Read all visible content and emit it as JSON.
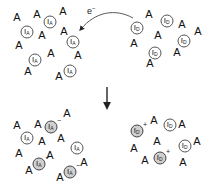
{
  "diagram": {
    "electron_label": "e",
    "electron_sign": "−",
    "colors": {
      "ink": "#111111",
      "neutral_fill": "#ffffff",
      "ion_fill": "#cfcfcf",
      "outline": "#555555"
    },
    "panels": {
      "top_left": {
        "species": "I",
        "subscript": "A",
        "A": [
          [
            17,
            17
          ],
          [
            37,
            14
          ],
          [
            63,
            11
          ],
          [
            42,
            35
          ],
          [
            64,
            31
          ],
          [
            19,
            45
          ],
          [
            51,
            53
          ],
          [
            78,
            55
          ],
          [
            28,
            71
          ],
          [
            59,
            76
          ]
        ],
        "molecules": [
          {
            "x": 50,
            "y": 22,
            "ion": false,
            "charge": ""
          },
          {
            "x": 27,
            "y": 32,
            "ion": false,
            "charge": ""
          },
          {
            "x": 73,
            "y": 42,
            "ion": false,
            "charge": ""
          },
          {
            "x": 35,
            "y": 60,
            "ion": false,
            "charge": ""
          },
          {
            "x": 70,
            "y": 71,
            "ion": false,
            "charge": ""
          }
        ]
      },
      "top_right": {
        "species": "I",
        "subscript": "D",
        "A": [
          [
            149,
            14
          ],
          [
            182,
            24
          ],
          [
            198,
            31
          ],
          [
            158,
            35
          ],
          [
            134,
            43
          ],
          [
            177,
            52
          ],
          [
            150,
            63
          ]
        ],
        "molecules": [
          {
            "x": 167,
            "y": 21,
            "ion": false,
            "charge": ""
          },
          {
            "x": 137,
            "y": 28,
            "ion": false,
            "charge": ""
          },
          {
            "x": 184,
            "y": 41,
            "ion": false,
            "charge": ""
          },
          {
            "x": 155,
            "y": 53,
            "ion": false,
            "charge": ""
          }
        ]
      },
      "bottom_left": {
        "species": "I",
        "subscript": "A",
        "A": [
          [
            67,
            113
          ],
          [
            17,
            125
          ],
          [
            38,
            124
          ],
          [
            42,
            141
          ],
          [
            61,
            138
          ],
          [
            19,
            153
          ],
          [
            50,
            155
          ],
          [
            84,
            162
          ],
          [
            29,
            170
          ],
          [
            60,
            177
          ]
        ],
        "molecules": [
          {
            "x": 51,
            "y": 127,
            "ion": true,
            "charge": "−"
          },
          {
            "x": 27,
            "y": 138,
            "ion": false,
            "charge": ""
          },
          {
            "x": 77,
            "y": 148,
            "ion": false,
            "charge": ""
          },
          {
            "x": 39,
            "y": 164,
            "ion": true,
            "charge": "−"
          },
          {
            "x": 70,
            "y": 172,
            "ion": true,
            "charge": "−"
          }
        ]
      },
      "bottom_right": {
        "species": "I",
        "subscript": "D",
        "A": [
          [
            154,
            120
          ],
          [
            182,
            124
          ],
          [
            157,
            141
          ],
          [
            134,
            148
          ],
          [
            197,
            141
          ],
          [
            145,
            160
          ],
          [
            183,
            162
          ]
        ],
        "molecules": [
          {
            "x": 170,
            "y": 125,
            "ion": false,
            "charge": ""
          },
          {
            "x": 137,
            "y": 131,
            "ion": true,
            "charge": "+"
          },
          {
            "x": 185,
            "y": 146,
            "ion": false,
            "charge": ""
          },
          {
            "x": 160,
            "y": 158,
            "ion": true,
            "charge": "+"
          }
        ]
      }
    },
    "letter_A": "A"
  }
}
